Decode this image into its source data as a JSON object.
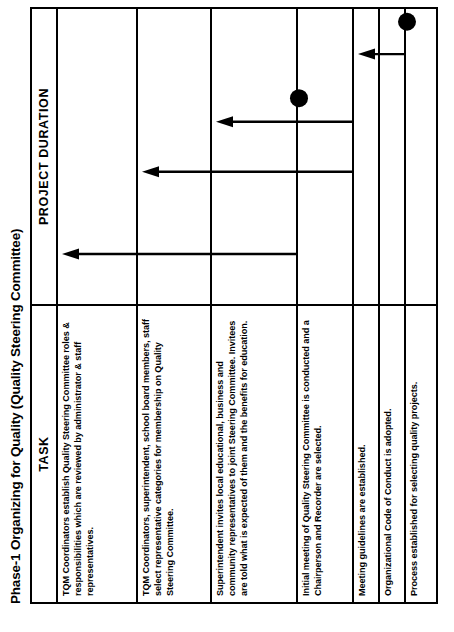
{
  "figure": {
    "title": "Phase-1 Organizing for Quality (Quality Steering Committee)",
    "header": {
      "task_label": "TASK",
      "duration_label": "PROJECT DURATION"
    }
  },
  "chart_data": {
    "type": "bar",
    "title": "Phase-1 Organizing for Quality (Quality Steering Committee)",
    "xlabel": "PROJECT DURATION",
    "ylabel": "TASK",
    "grid": true,
    "legend": "none",
    "categories": [
      "TQM Coordinators establish Quality Steering Committee roles & responsibilities which are reviewed by administrator & staff representatives.",
      "TQM Coordinators, superintendent, school board members, staff select representative categories for membership on Quality Steering Committee.",
      "Superintendent invites local educational, business and community representatives to joint Steering Committee.  Invitees are told what is expected of them and the benefits for education.",
      "Initial meeting of Quality Steering Committee is conducted and a Chairperson and Recorder are selected.",
      "Meeting guidelines are established.",
      "Organizational Code of Conduct is adopted.",
      "Process established for selecting quality projects."
    ],
    "rows": [
      {
        "index": 1,
        "task": "TQM Coordinators establish Quality Steering Committee roles & responsibilities which are reviewed by administrator & staff representatives.",
        "marker": "arrow",
        "start_pct": 17.0,
        "end_pct": 17.0,
        "marker_span_rows": 2
      },
      {
        "index": 2,
        "task": "TQM Coordinators, superintendent, school board members, staff select representative categories for membership on Quality Steering Committee.",
        "marker": "arrow",
        "start_pct": 45.0,
        "end_pct": 45.0,
        "marker_span_rows": 2
      },
      {
        "index": 3,
        "task": "Superintendent invites local educational, business and community representatives to joint Steering Committee.  Invitees are told what is expected of them and the benefits for education.",
        "marker": "arrow",
        "start_pct": 62.0,
        "end_pct": 62.0,
        "marker_span_rows": 1
      },
      {
        "index": 4,
        "task": "Initial meeting of Quality Steering Committee is conducted and a Chairperson and Recorder are selected.",
        "marker": "dot",
        "start_pct": 70.0,
        "end_pct": 70.0,
        "marker_span_rows": 0
      },
      {
        "index": 5,
        "task": "Meeting guidelines are established.",
        "marker": "arrow",
        "start_pct": 85.0,
        "end_pct": 85.0,
        "marker_span_rows": 1
      },
      {
        "index": 6,
        "task": "Organizational Code of Conduct is adopted.",
        "marker": "none",
        "start_pct": null,
        "end_pct": null,
        "marker_span_rows": 0
      },
      {
        "index": 7,
        "task": "Process established for selecting quality projects.",
        "marker": "dot",
        "start_pct": 96.0,
        "end_pct": 96.0,
        "marker_span_rows": 0
      }
    ],
    "duration_divisions": 9,
    "colors": {
      "ink": "#000000",
      "paper": "#ffffff",
      "marker": "#000000"
    }
  },
  "markers": {
    "arrow_label": "task-arrow",
    "dot_label": "milestone-dot"
  }
}
